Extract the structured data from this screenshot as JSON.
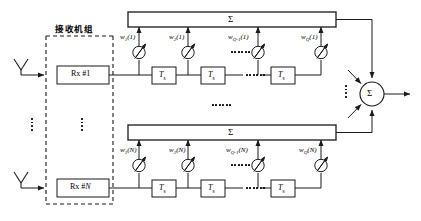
{
  "figure": {
    "type": "block-diagram",
    "group_label": "接收机组",
    "summation_symbol": "Σ",
    "delay_label": "T",
    "delay_subscript": "s",
    "colors": {
      "line": "#1a1a1a",
      "dashed": "#1a1a1a",
      "background": "#ffffff"
    }
  },
  "branches": [
    {
      "id": "branch-1",
      "index": "1",
      "receiver_label": "Rx #1",
      "antenna_name": "antenna",
      "weights": [
        {
          "name": "w",
          "sub": "1",
          "arg": "(1)",
          "text": "w₁(1)"
        },
        {
          "name": "w",
          "sub": "2",
          "arg": "(1)",
          "text": "w₂(1)"
        },
        {
          "name": "w",
          "sub": "Q-1",
          "arg": "(1)",
          "text": "w_{Q-1}(1)"
        },
        {
          "name": "w",
          "sub": "Q",
          "arg": "(1)",
          "text": "w_Q(1)"
        }
      ],
      "delays": [
        "T_s",
        "T_s",
        "T_s"
      ],
      "sum_label": "Σ"
    },
    {
      "id": "branch-N",
      "index": "N",
      "receiver_label": "Rx #N",
      "antenna_name": "antenna",
      "weights": [
        {
          "name": "w",
          "sub": "1",
          "arg": "(N)",
          "text": "w₁(N)"
        },
        {
          "name": "w",
          "sub": "2",
          "arg": "(N)",
          "text": "w₂(N)"
        },
        {
          "name": "w",
          "sub": "Q-1",
          "arg": "(N)",
          "text": "w_{Q-1}(N)"
        },
        {
          "name": "w",
          "sub": "Q",
          "arg": "(N)",
          "text": "w_Q(N)"
        }
      ],
      "delays": [
        "T_s",
        "T_s",
        "T_s"
      ],
      "sum_label": "Σ"
    }
  ],
  "output_adder": {
    "label": "Σ",
    "name": "final-summing-node"
  },
  "ellipses": {
    "branch_vertical": "⋮",
    "tap_horizontal": "⋯",
    "adder_vertical": "⋮"
  }
}
